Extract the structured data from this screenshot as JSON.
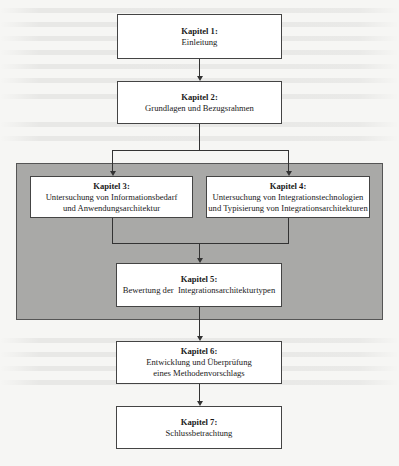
{
  "diagram": {
    "type": "flowchart",
    "chapters": [
      {
        "id": 1,
        "title": "Kapitel 1:",
        "lines": [
          "Einleitung"
        ]
      },
      {
        "id": 2,
        "title": "Kapitel 2:",
        "lines": [
          "Grundlagen und Bezugsrahmen"
        ]
      },
      {
        "id": 3,
        "title": "Kapitel 3:",
        "lines": [
          "Untersuchung von Informationsbedarf",
          "und Anwendungsarchitektur"
        ]
      },
      {
        "id": 4,
        "title": "Kapitel 4:",
        "lines": [
          "Untersuchung von Integrationstechnologien",
          "und Typisierung von Integrationsarchitekturen"
        ]
      },
      {
        "id": 5,
        "title": "Kapitel 5:",
        "lines": [
          "Bewertung der  Integrationsarchitekturtypen"
        ]
      },
      {
        "id": 6,
        "title": "Kapitel 6:",
        "lines": [
          "Entwicklung und Überprüfung",
          "eines Methodenvorschlags"
        ]
      },
      {
        "id": 7,
        "title": "Kapitel 7:",
        "lines": [
          "Schlussbetrachtung"
        ]
      }
    ],
    "edges": [
      {
        "from": 1,
        "to": 2
      },
      {
        "from": 2,
        "to": 3
      },
      {
        "from": 2,
        "to": 4
      },
      {
        "from": 3,
        "to": 5
      },
      {
        "from": 4,
        "to": 5
      },
      {
        "from": 5,
        "to": 6
      },
      {
        "from": 6,
        "to": 7
      }
    ],
    "highlight_group": {
      "members": [
        3,
        4,
        5
      ],
      "fill": "#a9a9a7"
    }
  }
}
